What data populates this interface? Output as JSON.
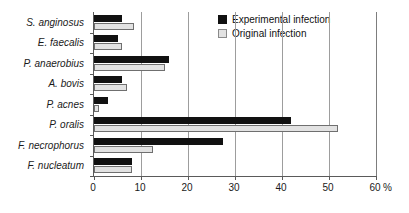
{
  "chart_data": {
    "type": "bar",
    "orientation": "horizontal",
    "title": "",
    "xlabel": "%",
    "ylabel": "",
    "xlim": [
      0,
      60
    ],
    "xticks": [
      0,
      10,
      20,
      30,
      40,
      50,
      60
    ],
    "grid": true,
    "legend_position": "top-right",
    "categories": [
      "S. anginosus",
      "E. faecalis",
      "P. anaerobius",
      "A. bovis",
      "P. acnes",
      "P. oralis",
      "F. necrophorus",
      "F. nucleatum"
    ],
    "series": [
      {
        "name": "Experimental infection",
        "color": "#111111",
        "values": [
          6,
          5,
          16,
          6,
          3,
          42,
          27.5,
          8
        ]
      },
      {
        "name": "Original infection",
        "color": "#e2e2e2",
        "values": [
          8.5,
          6,
          15,
          7,
          1,
          52,
          12.5,
          8
        ]
      }
    ]
  },
  "legend": {
    "entries": [
      {
        "label": "Experimental infection"
      },
      {
        "label": "Original infection"
      }
    ]
  },
  "axis": {
    "unit_label": "%"
  }
}
